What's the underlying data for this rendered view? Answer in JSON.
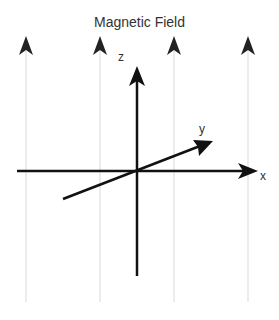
{
  "title": "Magnetic Field",
  "axes": {
    "x_label": "x",
    "y_label": "y",
    "z_label": "z"
  },
  "field_lines": {
    "count": 4,
    "direction": "up",
    "line_color": "#d9d9d9",
    "arrow_color": "#222222"
  },
  "axis_color": "#111111"
}
